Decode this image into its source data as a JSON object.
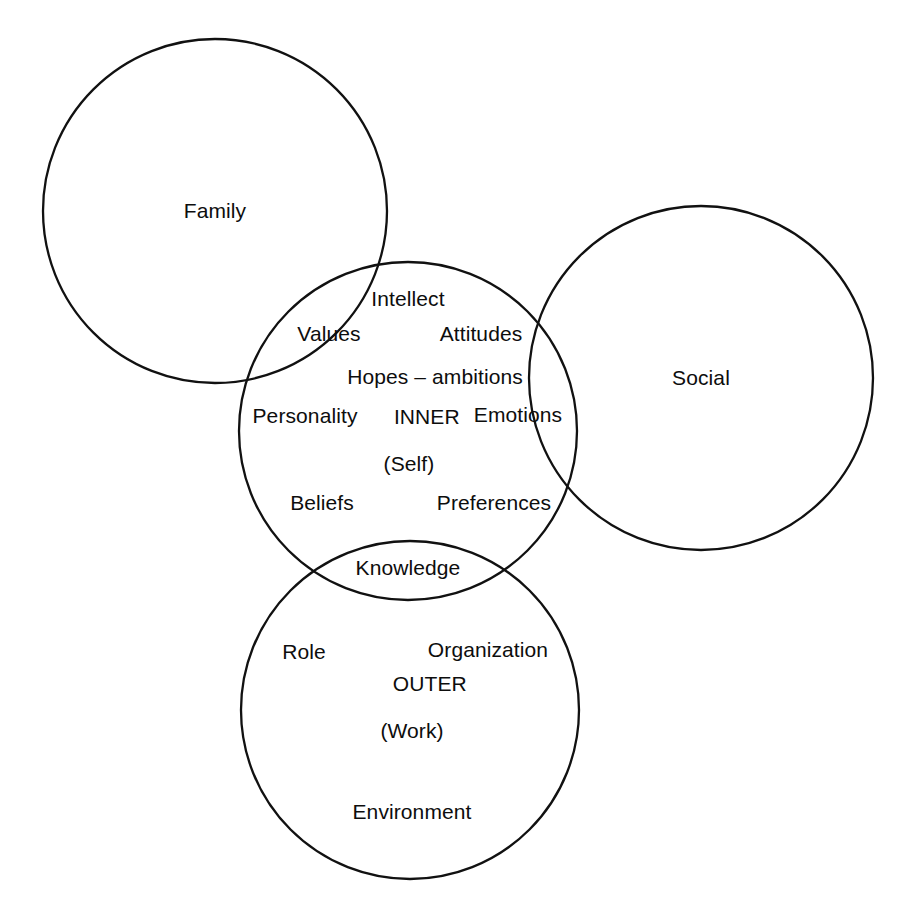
{
  "diagram": {
    "type": "venn",
    "background_color": "#ffffff",
    "stroke_color": "#111111",
    "text_color": "#0d0d0d",
    "canvas": {
      "width": 904,
      "height": 917
    },
    "circles": [
      {
        "name": "family",
        "label": "Family",
        "cx": 215,
        "cy": 211,
        "r": 172
      },
      {
        "name": "social",
        "label": "Social",
        "cx": 701,
        "cy": 378,
        "r": 172
      },
      {
        "name": "inner",
        "label": "INNER",
        "sublabel": "(Self)",
        "cx": 408,
        "cy": 431,
        "r": 169
      },
      {
        "name": "outer",
        "label": "OUTER",
        "sublabel": "(Work)",
        "cx": 410,
        "cy": 710,
        "r": 169
      }
    ],
    "circle_labels": {
      "family": "Family",
      "social": "Social"
    },
    "zones": {
      "inner": {
        "title": "INNER",
        "subtitle": "(Self)"
      },
      "outer": {
        "title": "OUTER",
        "subtitle": "(Work)"
      }
    },
    "inner_terms": [
      {
        "text": "Intellect",
        "x": 408,
        "y": 299
      },
      {
        "text": "Values",
        "x": 329,
        "y": 334
      },
      {
        "text": "Attitudes",
        "x": 481,
        "y": 334
      },
      {
        "text": "Hopes – ambitions",
        "x": 435,
        "y": 377
      },
      {
        "text": "Personality",
        "x": 305,
        "y": 416
      },
      {
        "text": "Emotions",
        "x": 518,
        "y": 415
      },
      {
        "text": "Beliefs",
        "x": 322,
        "y": 503
      },
      {
        "text": "Preferences",
        "x": 494,
        "y": 503
      },
      {
        "text": "Knowledge",
        "x": 408,
        "y": 568
      }
    ],
    "outer_terms": [
      {
        "text": "Role",
        "x": 304,
        "y": 652
      },
      {
        "text": "Organization",
        "x": 488,
        "y": 650
      },
      {
        "text": "Environment",
        "x": 412,
        "y": 812
      }
    ]
  }
}
